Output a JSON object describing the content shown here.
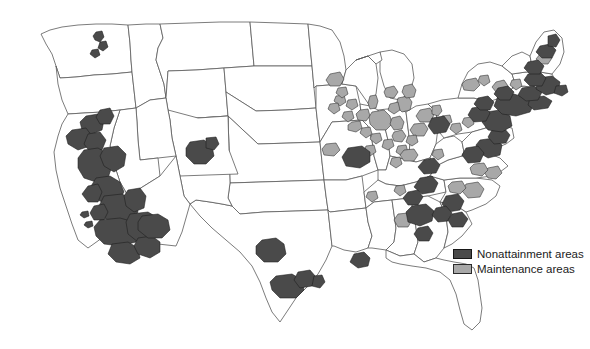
{
  "figure": {
    "title": ""
  },
  "legend": {
    "position": "bottom-right",
    "items": [
      {
        "label": "Nonattainment areas",
        "color": "#4a4a4a",
        "icon": "filled-square-dark"
      },
      {
        "label": "Maintenance areas",
        "color": "#a8a8a8",
        "icon": "filled-square-light"
      }
    ]
  },
  "map": {
    "region": "Contiguous United States",
    "base_fill": "#ffffff",
    "border_color": "#5a5a5a",
    "highlight_regions": [
      {
        "name": "California Central Valley and coast",
        "category": "nonattainment"
      },
      {
        "name": "Los Angeles South Coast",
        "category": "nonattainment"
      },
      {
        "name": "San Joaquin Valley",
        "category": "nonattainment"
      },
      {
        "name": "Las Vegas Clark County",
        "category": "nonattainment"
      },
      {
        "name": "Phoenix Maricopa County",
        "category": "nonattainment"
      },
      {
        "name": "Denver Front Range",
        "category": "nonattainment"
      },
      {
        "name": "Puget Sound",
        "category": "nonattainment"
      },
      {
        "name": "Dallas-Fort Worth",
        "category": "nonattainment"
      },
      {
        "name": "Houston-Galveston-Brazoria",
        "category": "nonattainment"
      },
      {
        "name": "Baton Rouge",
        "category": "nonattainment"
      },
      {
        "name": "St. Louis",
        "category": "nonattainment"
      },
      {
        "name": "Chicago-Gary-Lake County",
        "category": "maintenance"
      },
      {
        "name": "Detroit-Ann Arbor",
        "category": "maintenance"
      },
      {
        "name": "Milwaukee-Racine",
        "category": "maintenance"
      },
      {
        "name": "Cleveland-Akron-Lorain",
        "category": "maintenance"
      },
      {
        "name": "Cincinnati-Hamilton",
        "category": "maintenance"
      },
      {
        "name": "Pittsburgh-Beaver Valley",
        "category": "nonattainment"
      },
      {
        "name": "Atlanta",
        "category": "nonattainment"
      },
      {
        "name": "Charlotte-Gastonia",
        "category": "nonattainment"
      },
      {
        "name": "Raleigh-Durham",
        "category": "maintenance"
      },
      {
        "name": "Knoxville",
        "category": "nonattainment"
      },
      {
        "name": "Birmingham",
        "category": "maintenance"
      },
      {
        "name": "Washington DC metro",
        "category": "nonattainment"
      },
      {
        "name": "Baltimore",
        "category": "nonattainment"
      },
      {
        "name": "Philadelphia-Wilmington-Trenton",
        "category": "nonattainment"
      },
      {
        "name": "New York-Northern New Jersey-Long Island",
        "category": "nonattainment"
      },
      {
        "name": "Boston-Lawrence-Worcester",
        "category": "nonattainment"
      },
      {
        "name": "Providence",
        "category": "nonattainment"
      },
      {
        "name": "Hartford-New Haven",
        "category": "nonattainment"
      },
      {
        "name": "Portland Maine coastal",
        "category": "nonattainment"
      },
      {
        "name": "Richmond-Hampton Roads",
        "category": "nonattainment"
      }
    ]
  }
}
